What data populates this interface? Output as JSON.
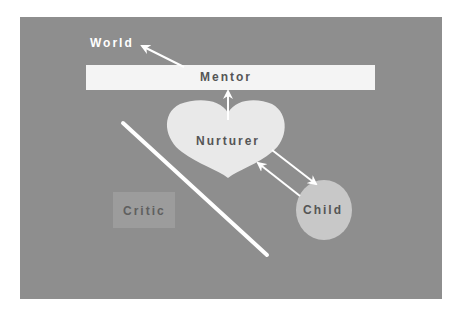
{
  "diagram": {
    "type": "relationship-diagram",
    "background_color": "#8e8e8e",
    "nodes": [
      {
        "id": "world",
        "label": "World",
        "shape": "text",
        "color": "#ffffff"
      },
      {
        "id": "mentor",
        "label": "Mentor",
        "shape": "bar",
        "fill": "#f4f4f4"
      },
      {
        "id": "nurturer",
        "label": "Nurturer",
        "shape": "heart",
        "fill": "#e9e9e9"
      },
      {
        "id": "critic",
        "label": "Critic",
        "shape": "rectangle",
        "fill": "#9c9c9c"
      },
      {
        "id": "child",
        "label": "Child",
        "shape": "circle",
        "fill": "#c8c8c8"
      }
    ],
    "edges": [
      {
        "from": "mentor",
        "to": "world",
        "type": "arrow"
      },
      {
        "from": "nurturer",
        "to": "mentor",
        "type": "arrow"
      },
      {
        "from": "nurturer",
        "to": "child",
        "type": "arrow"
      },
      {
        "from": "child",
        "to": "nurturer",
        "type": "arrow"
      }
    ],
    "separator": {
      "type": "diagonal-line",
      "color": "#ffffff"
    }
  },
  "labels": {
    "world": "World",
    "mentor": "Mentor",
    "nurturer": "Nurturer",
    "critic": "Critic",
    "child": "Child"
  }
}
